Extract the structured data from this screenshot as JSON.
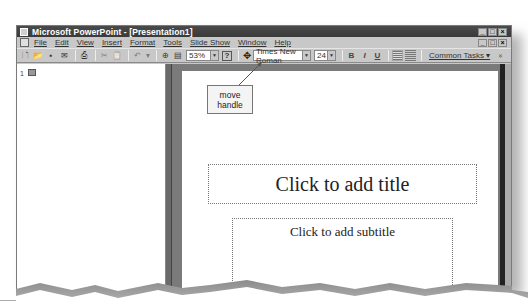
{
  "window": {
    "title": "Microsoft PowerPoint - [Presentation1]",
    "controls": [
      "_",
      "□",
      "×"
    ]
  },
  "menubar": {
    "items": [
      "File",
      "Edit",
      "View",
      "Insert",
      "Format",
      "Tools",
      "Slide Show",
      "Window",
      "Help"
    ],
    "doc_controls": [
      "_",
      "□",
      "×"
    ]
  },
  "toolbar": {
    "standard_icons": [
      "new-icon",
      "open-icon",
      "save-icon",
      "email-icon",
      "print-icon",
      "cut-icon",
      "paste-icon",
      "undo-icon",
      "insert-hyperlink-icon",
      "tables-icon"
    ],
    "zoom": "53%",
    "help_icon": "?",
    "font": "Times New Roman",
    "font_size": "24",
    "bold": "B",
    "italic": "I",
    "underline": "U",
    "common_tasks": "Common Tasks ▾",
    "overflow": "»"
  },
  "outline": {
    "slide_number": "1"
  },
  "slide": {
    "title_placeholder": "Click to add title",
    "subtitle_placeholder": "Click to add subtitle"
  },
  "annotation": {
    "callout_line1": "move",
    "callout_line2": "handle"
  }
}
